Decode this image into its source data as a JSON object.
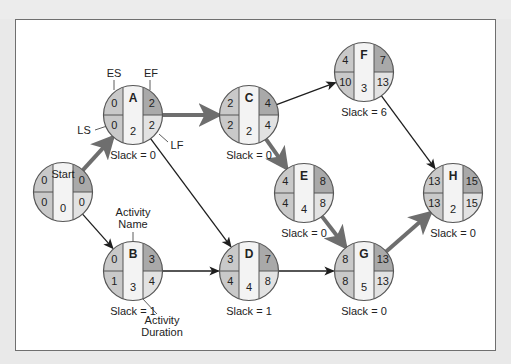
{
  "diagram": {
    "type": "activity-on-node network (critical path)",
    "colors": {
      "background": "#e9e9e9",
      "canvas": "#ffffff",
      "frame": "#6f6f6f",
      "es_ls_cell": "#c9c9c9",
      "ef_cell": "#a9a9a9",
      "lf_cell": "#e2e2e2",
      "name_cell": "#f3f3f3",
      "critical_arrow": "#6e6e6e",
      "normal_arrow": "#1e1e1e",
      "node_stroke": "#555555"
    },
    "nodes": [
      {
        "id": "Start",
        "name": "Start",
        "es": "0",
        "ef": "0",
        "ls": "0",
        "lf": "0",
        "duration": "0",
        "slack": "",
        "cx": 63,
        "cy": 192
      },
      {
        "id": "A",
        "name": "A",
        "es": "0",
        "ef": "2",
        "ls": "0",
        "lf": "2",
        "duration": "2",
        "slack": "Slack = 0",
        "cx": 133,
        "cy": 115
      },
      {
        "id": "B",
        "name": "B",
        "es": "0",
        "ef": "3",
        "ls": "1",
        "lf": "4",
        "duration": "3",
        "slack": "Slack = 1",
        "cx": 133,
        "cy": 271
      },
      {
        "id": "C",
        "name": "C",
        "es": "2",
        "ef": "4",
        "ls": "2",
        "lf": "4",
        "duration": "2",
        "slack": "Slack = 0",
        "cx": 249,
        "cy": 115
      },
      {
        "id": "D",
        "name": "D",
        "es": "3",
        "ef": "7",
        "ls": "4",
        "lf": "8",
        "duration": "4",
        "slack": "Slack = 1",
        "cx": 249,
        "cy": 271
      },
      {
        "id": "E",
        "name": "E",
        "es": "4",
        "ef": "8",
        "ls": "4",
        "lf": "8",
        "duration": "4",
        "slack": "Slack = 0",
        "cx": 304,
        "cy": 193
      },
      {
        "id": "F",
        "name": "F",
        "es": "4",
        "ef": "7",
        "ls": "10",
        "lf": "13",
        "duration": "3",
        "slack": "Slack = 6",
        "cx": 364,
        "cy": 72
      },
      {
        "id": "G",
        "name": "G",
        "es": "8",
        "ef": "13",
        "ls": "8",
        "lf": "13",
        "duration": "5",
        "slack": "Slack = 0",
        "cx": 364,
        "cy": 271
      },
      {
        "id": "H",
        "name": "H",
        "es": "13",
        "ef": "15",
        "ls": "13",
        "lf": "15",
        "duration": "2",
        "slack": "Slack = 0",
        "cx": 453,
        "cy": 193
      }
    ],
    "edges": [
      {
        "from": "Start",
        "to": "A",
        "critical": true
      },
      {
        "from": "Start",
        "to": "B",
        "critical": false
      },
      {
        "from": "A",
        "to": "C",
        "critical": true
      },
      {
        "from": "A",
        "to": "D",
        "critical": false
      },
      {
        "from": "B",
        "to": "D",
        "critical": false
      },
      {
        "from": "C",
        "to": "E",
        "critical": true
      },
      {
        "from": "C",
        "to": "F",
        "critical": false
      },
      {
        "from": "D",
        "to": "G",
        "critical": false
      },
      {
        "from": "E",
        "to": "G",
        "critical": true
      },
      {
        "from": "F",
        "to": "H",
        "critical": false
      },
      {
        "from": "G",
        "to": "H",
        "critical": true
      }
    ],
    "legend_labels": {
      "es": "ES",
      "ef": "EF",
      "ls": "LS",
      "lf": "LF",
      "activity_name_line1": "Activity",
      "activity_name_line2": "Name",
      "activity_duration_line1": "Activity",
      "activity_duration_line2": "Duration"
    }
  }
}
